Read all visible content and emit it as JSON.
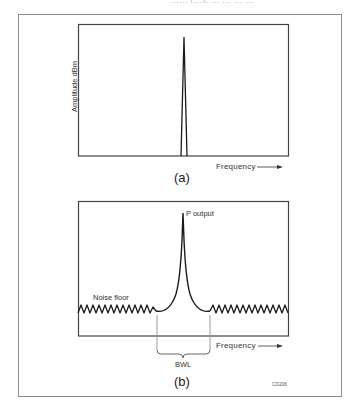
{
  "header": {
    "cut_off_text": "…… (…), … … … …"
  },
  "figure_a": {
    "caption": "(a)",
    "y_axis_label": "Amplitude dBm",
    "x_axis_label": "Frequency",
    "x_axis_arrow": "→",
    "content": "single narrow spectral line at center frequency"
  },
  "figure_b": {
    "caption": "(b)",
    "x_axis_label": "Frequency",
    "x_axis_arrow": "→",
    "peak_label": "P output",
    "noise_label": "Noise floor",
    "bandwidth_label": "BWL",
    "content": "spectral line with skirts rising out of noise floor; BWL bracket marks bandwidth limit"
  },
  "figure_id": "CD208",
  "colors": {
    "line": "#1a1a1a",
    "frame": "#8c8c8c",
    "bwl_marker": "#9a9a9a",
    "background": "#ffffff"
  }
}
